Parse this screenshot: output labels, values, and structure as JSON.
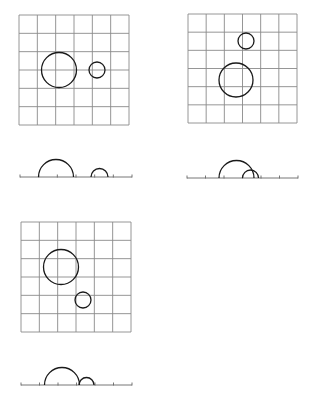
{
  "diagram": {
    "colors": {
      "grid": "#8a8a8a",
      "circle": "#1a1a1a",
      "axis": "#666666",
      "background": "#ffffff"
    },
    "panels": [
      {
        "id": "panel-1",
        "grid": {
          "x": 19,
          "y": 15,
          "size": 110,
          "cells": 6
        },
        "circles": [
          {
            "name": "large",
            "cx": 59,
            "cy": 70,
            "r": 17.5
          },
          {
            "name": "small",
            "cx": 97,
            "cy": 70,
            "r": 8
          }
        ],
        "projection": {
          "axis_y": 177,
          "x1": 20,
          "x2": 132,
          "ticks": 7,
          "arcs": [
            {
              "name": "large",
              "cx": 56,
              "r": 17.5
            },
            {
              "name": "small",
              "cx": 99.5,
              "r": 8.5
            }
          ]
        }
      },
      {
        "id": "panel-2",
        "grid": {
          "x": 188,
          "y": 14,
          "size": 109,
          "cells": 6
        },
        "circles": [
          {
            "name": "small",
            "cx": 246,
            "cy": 41,
            "r": 8
          },
          {
            "name": "large",
            "cx": 236,
            "cy": 80,
            "r": 17
          }
        ],
        "projection": {
          "axis_y": 178,
          "x1": 187,
          "x2": 298,
          "ticks": 7,
          "arcs": [
            {
              "name": "large",
              "cx": 236.5,
              "r": 17.5
            },
            {
              "name": "small",
              "cx": 250.5,
              "r": 8
            }
          ]
        }
      },
      {
        "id": "panel-3",
        "grid": {
          "x": 21,
          "y": 222,
          "size": 110,
          "cells": 6
        },
        "circles": [
          {
            "name": "large",
            "cx": 61,
            "cy": 267,
            "r": 17.5
          },
          {
            "name": "small",
            "cx": 83,
            "cy": 300,
            "r": 8
          }
        ],
        "projection": {
          "axis_y": 385,
          "x1": 21,
          "x2": 132,
          "ticks": 7,
          "arcs": [
            {
              "name": "large",
              "cx": 62,
              "r": 17.5
            },
            {
              "name": "small",
              "cx": 86.5,
              "r": 7.5
            }
          ]
        }
      }
    ]
  }
}
